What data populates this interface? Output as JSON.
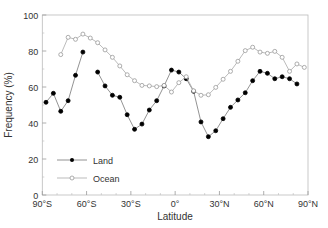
{
  "chart_data": {
    "type": "line",
    "title": "",
    "xlabel": "Latitude",
    "ylabel": "Frequency (%)",
    "xlim": [
      -90,
      90
    ],
    "ylim": [
      0,
      100
    ],
    "x_ticks": [
      -90,
      -60,
      -30,
      0,
      30,
      60,
      90
    ],
    "x_tick_labels": [
      "90°S",
      "60°S",
      "30°S",
      "0°",
      "30°N",
      "60°N",
      "90°N"
    ],
    "y_ticks": [
      0,
      20,
      40,
      60,
      80,
      100
    ],
    "y_tick_labels": [
      "0",
      "20",
      "40",
      "60",
      "80",
      "100"
    ],
    "grid": false,
    "legend_position": "lower left",
    "series": [
      {
        "name": "Land",
        "marker": "filled-circle",
        "color": "#000000",
        "segments": [
          [
            [
              -87.5,
              51.5
            ],
            [
              -82.5,
              56.5
            ],
            [
              -77.5,
              46.5
            ],
            [
              -72.5,
              52.4
            ],
            [
              -67.5,
              66.5
            ],
            [
              -62.5,
              79.4
            ]
          ],
          [
            [
              -52.5,
              68.3
            ],
            [
              -47.5,
              60.6
            ],
            [
              -42.5,
              55.4
            ],
            [
              -37.5,
              54.3
            ],
            [
              -32.5,
              44.6
            ],
            [
              -27.5,
              36.5
            ],
            [
              -22.5,
              39.4
            ],
            [
              -17.5,
              47.2
            ],
            [
              -12.5,
              52.4
            ],
            [
              -7.5,
              60.6
            ],
            [
              -2.5,
              69.4
            ],
            [
              2.5,
              68.3
            ],
            [
              7.5,
              64.6
            ],
            [
              12.5,
              57.6
            ],
            [
              17.5,
              40.6
            ],
            [
              22.5,
              32.4
            ],
            [
              27.5,
              35.7
            ],
            [
              32.5,
              42.4
            ],
            [
              37.5,
              48.7
            ],
            [
              42.5,
              52.8
            ],
            [
              47.5,
              56.8
            ],
            [
              52.5,
              63.5
            ],
            [
              57.5,
              68.7
            ],
            [
              62.5,
              67.6
            ],
            [
              67.5,
              64.6
            ],
            [
              72.5,
              65.7
            ],
            [
              77.5,
              64.6
            ],
            [
              82.5,
              61.7
            ]
          ]
        ]
      },
      {
        "name": "Ocean",
        "marker": "open-circle",
        "color": "#999999",
        "segments": [
          [
            [
              -77.5,
              78.0
            ],
            [
              -72.5,
              87.6
            ],
            [
              -67.5,
              86.5
            ],
            [
              -62.5,
              89.4
            ],
            [
              -57.5,
              87.2
            ],
            [
              -52.5,
              84.6
            ],
            [
              -47.5,
              80.6
            ],
            [
              -42.5,
              76.5
            ],
            [
              -37.5,
              71.7
            ],
            [
              -32.5,
              66.8
            ],
            [
              -27.5,
              63.5
            ],
            [
              -22.5,
              60.9
            ],
            [
              -17.5,
              60.6
            ],
            [
              -12.5,
              60.2
            ],
            [
              -7.5,
              60.9
            ],
            [
              -2.5,
              57.2
            ],
            [
              2.5,
              62.4
            ],
            [
              7.5,
              65.7
            ],
            [
              12.5,
              57.9
            ],
            [
              17.5,
              55.4
            ],
            [
              22.5,
              55.7
            ],
            [
              27.5,
              59.8
            ],
            [
              32.5,
              64.3
            ],
            [
              37.5,
              68.7
            ],
            [
              42.5,
              74.3
            ],
            [
              47.5,
              80.2
            ],
            [
              52.5,
              82.1
            ],
            [
              57.5,
              79.4
            ],
            [
              62.5,
              78.7
            ],
            [
              67.5,
              79.8
            ],
            [
              72.5,
              76.5
            ],
            [
              77.5,
              68.7
            ],
            [
              82.5,
              72.8
            ],
            [
              87.5,
              70.9
            ]
          ]
        ]
      }
    ]
  },
  "legend": {
    "items": [
      {
        "label": "Land"
      },
      {
        "label": "Ocean"
      }
    ]
  }
}
